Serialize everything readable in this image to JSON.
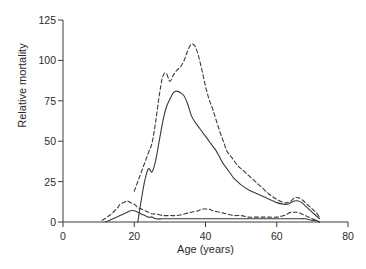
{
  "figure": {
    "background_color": "#ffffff",
    "line_color": "#3a3a3a",
    "text_color": "#2b2b2b"
  },
  "chart_data": {
    "type": "line",
    "title": "",
    "subtitle": "",
    "xlabel": "Age (years)",
    "ylabel": "Relative mortality",
    "xlim": [
      0,
      80
    ],
    "ylim": [
      0,
      125
    ],
    "xticks": [
      0,
      20,
      40,
      60,
      80
    ],
    "yticks": [
      0,
      25,
      50,
      75,
      100,
      125
    ],
    "xtick_labels": [
      "0",
      "20",
      "40",
      "60",
      "80"
    ],
    "ytick_labels": [
      "0",
      "25",
      "50",
      "75",
      "100",
      "125"
    ],
    "grid": false,
    "legend": "none",
    "legend_position": "none",
    "annotations": [],
    "series": [
      {
        "name": "upper-dashed",
        "style": "dashed",
        "color": "#3a3a3a",
        "x": [
          20,
          21,
          22,
          23,
          24,
          25,
          26,
          27,
          28,
          29,
          30,
          31,
          32,
          33,
          34,
          35,
          36,
          37,
          38,
          39,
          40,
          41,
          42,
          43,
          44,
          45,
          46,
          47,
          48,
          49,
          50,
          52,
          54,
          56,
          58,
          60,
          62,
          63,
          64,
          65,
          66,
          67,
          68,
          69,
          70,
          71,
          72
        ],
        "y": [
          19,
          25,
          31,
          37,
          43,
          49,
          62,
          78,
          90,
          92,
          87,
          91,
          94,
          96,
          100,
          106,
          110,
          109,
          103,
          94,
          84,
          76,
          70,
          63,
          56,
          50,
          44,
          41,
          38,
          35,
          33,
          29,
          25,
          21,
          17,
          14,
          12,
          12,
          13,
          15,
          15,
          14,
          12,
          10,
          8,
          6,
          3
        ]
      },
      {
        "name": "upper-solid",
        "style": "solid",
        "color": "#3a3a3a",
        "x": [
          21,
          22,
          23,
          24,
          25,
          26,
          27,
          28,
          29,
          30,
          31,
          32,
          33,
          34,
          35,
          36,
          37,
          38,
          39,
          40,
          41,
          42,
          43,
          44,
          45,
          46,
          47,
          48,
          49,
          50,
          52,
          54,
          56,
          58,
          60,
          62,
          63,
          64,
          65,
          66,
          67,
          68,
          69,
          70,
          71,
          72
        ],
        "y": [
          0,
          14,
          26,
          33,
          31,
          38,
          50,
          62,
          71,
          76,
          80,
          81,
          80,
          78,
          73,
          66,
          62,
          59,
          56,
          53,
          50,
          47,
          44,
          40,
          36,
          33,
          30,
          27,
          25,
          23,
          20,
          18,
          16,
          14,
          12,
          11,
          11,
          12,
          13,
          13,
          12,
          10,
          8,
          6,
          4,
          2
        ]
      },
      {
        "name": "lower-dashed",
        "style": "dashed",
        "color": "#3a3a3a",
        "x": [
          11,
          13,
          15,
          16,
          17,
          18,
          19,
          20,
          21,
          22,
          23,
          24,
          25,
          26,
          28,
          30,
          32,
          34,
          36,
          38,
          39,
          40,
          41,
          42,
          44,
          46,
          48,
          50,
          52,
          54,
          56,
          58,
          60,
          62,
          63,
          64,
          65,
          66,
          67,
          68,
          69,
          70,
          71,
          72
        ],
        "y": [
          1,
          4,
          8,
          11,
          12,
          13,
          12,
          11,
          9,
          8,
          7,
          6,
          5,
          5,
          4,
          4,
          4,
          5,
          6,
          7,
          8,
          8,
          8,
          7,
          6,
          5,
          4,
          4,
          3,
          3,
          3,
          3,
          3,
          4,
          5,
          6,
          6,
          6,
          5,
          4,
          3,
          2,
          1,
          0
        ]
      },
      {
        "name": "lower-solid",
        "style": "solid",
        "color": "#3a3a3a",
        "x": [
          12,
          14,
          16,
          17,
          18,
          19,
          20,
          21,
          22,
          23,
          24,
          25,
          26,
          28,
          30,
          32,
          34,
          36,
          38,
          40,
          42,
          44,
          46,
          48,
          50,
          52,
          54,
          56,
          58,
          60,
          62,
          64,
          66,
          68,
          70,
          71,
          72
        ],
        "y": [
          0,
          2,
          4,
          5,
          6,
          7,
          7,
          6,
          5,
          4,
          3,
          3,
          2,
          2,
          2,
          2,
          2,
          2,
          2,
          2,
          2,
          2,
          2,
          2,
          2,
          2,
          2,
          2,
          2,
          2,
          2,
          2,
          2,
          2,
          1,
          1,
          0
        ]
      }
    ]
  }
}
